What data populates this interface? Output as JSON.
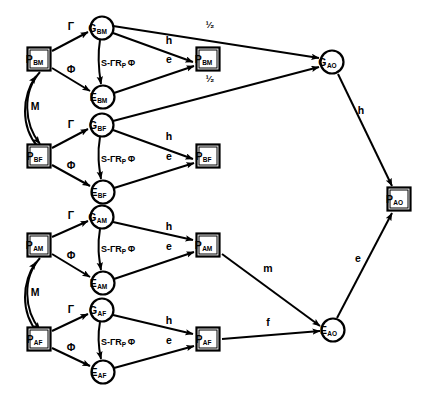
{
  "diagram": {
    "colors": {
      "stroke": "#000000",
      "fill": "#ffffff",
      "background": "#ffffff"
    },
    "nodes": [
      {
        "id": "P_BM",
        "name": "p-bm-box",
        "shape": "box",
        "base": "P",
        "sub": "BM",
        "x": 39,
        "y": 59
      },
      {
        "id": "G_BM",
        "name": "g-bm-node",
        "shape": "circle",
        "base": "G",
        "sub": "BM",
        "x": 102,
        "y": 28
      },
      {
        "id": "E_BM",
        "name": "e-bm-node",
        "shape": "circle",
        "base": "E",
        "sub": "BM",
        "x": 103,
        "y": 97
      },
      {
        "id": "PO_BM",
        "name": "p-bm-out-box",
        "shape": "box",
        "base": "P",
        "sub": "BM",
        "x": 208,
        "y": 59
      },
      {
        "id": "P_BF",
        "name": "p-bf-box",
        "shape": "box",
        "base": "P",
        "sub": "BF",
        "x": 39,
        "y": 156
      },
      {
        "id": "G_BF",
        "name": "g-bf-node",
        "shape": "circle",
        "base": "G",
        "sub": "BF",
        "x": 102,
        "y": 125
      },
      {
        "id": "E_BF",
        "name": "e-bf-node",
        "shape": "circle",
        "base": "E",
        "sub": "BF",
        "x": 103,
        "y": 192
      },
      {
        "id": "PO_BF",
        "name": "p-bf-out-box",
        "shape": "box",
        "base": "P",
        "sub": "BF",
        "x": 208,
        "y": 156
      },
      {
        "id": "P_AM",
        "name": "p-am-box",
        "shape": "box",
        "base": "P",
        "sub": "AM",
        "x": 39,
        "y": 245
      },
      {
        "id": "G_AM",
        "name": "g-am-node",
        "shape": "circle",
        "base": "G",
        "sub": "AM",
        "x": 102,
        "y": 217
      },
      {
        "id": "E_AM",
        "name": "e-am-node",
        "shape": "circle",
        "base": "E",
        "sub": "AM",
        "x": 103,
        "y": 283
      },
      {
        "id": "PO_AM",
        "name": "p-am-out-box",
        "shape": "box",
        "base": "P",
        "sub": "AM",
        "x": 208,
        "y": 245
      },
      {
        "id": "P_AF",
        "name": "p-af-box",
        "shape": "box",
        "base": "P",
        "sub": "AF",
        "x": 39,
        "y": 339
      },
      {
        "id": "G_AF",
        "name": "g-af-node",
        "shape": "circle",
        "base": "G",
        "sub": "AF",
        "x": 102,
        "y": 310
      },
      {
        "id": "E_AF",
        "name": "e-af-node",
        "shape": "circle",
        "base": "E",
        "sub": "AF",
        "x": 103,
        "y": 372
      },
      {
        "id": "PO_AF",
        "name": "p-af-out-box",
        "shape": "box",
        "base": "P",
        "sub": "AF",
        "x": 208,
        "y": 339
      },
      {
        "id": "G_AO",
        "name": "g-ao-node",
        "shape": "circle",
        "base": "G",
        "sub": "AO",
        "x": 332,
        "y": 62
      },
      {
        "id": "P_AO",
        "name": "p-ao-box",
        "shape": "box",
        "base": "P",
        "sub": "AO",
        "x": 399,
        "y": 199
      },
      {
        "id": "E_AO",
        "name": "e-ao-node",
        "shape": "circle",
        "base": "E",
        "sub": "AO",
        "x": 333,
        "y": 330
      }
    ],
    "edges": [
      {
        "name": "edge-pbm-gbm",
        "from": "P_BM",
        "to": "G_BM",
        "label": "Γ",
        "lx": 71,
        "ly": 30
      },
      {
        "name": "edge-pbm-ebm",
        "from": "P_BM",
        "to": "E_BM",
        "label": "Φ",
        "lx": 71,
        "ly": 73
      },
      {
        "name": "edge-gbm-ebm",
        "from": "G_BM",
        "to": "E_BM",
        "label": "S-ΓR",
        "sublabel": "P",
        "tail": "Φ",
        "lx": 118,
        "ly": 66,
        "curved": true
      },
      {
        "name": "edge-gbm-pbm",
        "from": "G_BM",
        "to": "PO_BM",
        "label": "h",
        "lx": 169,
        "ly": 44
      },
      {
        "name": "edge-ebm-pbm",
        "from": "E_BM",
        "to": "PO_BM",
        "label": "e",
        "lx": 169,
        "ly": 63
      },
      {
        "name": "edge-gbm-gao",
        "from": "G_BM",
        "to": "G_AO",
        "label": "¹⁄₂",
        "lx": 210,
        "ly": 28
      },
      {
        "name": "edge-gbf-gao",
        "from": "G_BF",
        "to": "G_AO",
        "label": "¹⁄₂",
        "lx": 210,
        "ly": 82
      },
      {
        "name": "edge-pbf-gbf",
        "from": "P_BF",
        "to": "G_BF",
        "label": "Γ",
        "lx": 71,
        "ly": 128
      },
      {
        "name": "edge-pbf-ebf",
        "from": "P_BF",
        "to": "E_BF",
        "label": "Φ",
        "lx": 71,
        "ly": 169
      },
      {
        "name": "edge-gbf-ebf",
        "from": "G_BF",
        "to": "E_BF",
        "label": "S-ΓR",
        "sublabel": "P",
        "tail": "Φ",
        "lx": 118,
        "ly": 162,
        "curved": true
      },
      {
        "name": "edge-gbf-pbf",
        "from": "G_BF",
        "to": "PO_BF",
        "label": "h",
        "lx": 169,
        "ly": 140
      },
      {
        "name": "edge-ebf-pbf",
        "from": "E_BF",
        "to": "PO_BF",
        "label": "e",
        "lx": 169,
        "ly": 160
      },
      {
        "name": "edge-pam-gam",
        "from": "P_AM",
        "to": "G_AM",
        "label": "Γ",
        "lx": 71,
        "ly": 219
      },
      {
        "name": "edge-pam-eam",
        "from": "P_AM",
        "to": "E_AM",
        "label": "Φ",
        "lx": 71,
        "ly": 259
      },
      {
        "name": "edge-gam-eam",
        "from": "G_AM",
        "to": "E_AM",
        "label": "S-ΓR",
        "sublabel": "P",
        "tail": "Φ",
        "lx": 118,
        "ly": 252,
        "curved": true
      },
      {
        "name": "edge-gam-pam",
        "from": "G_AM",
        "to": "PO_AM",
        "label": "h",
        "lx": 169,
        "ly": 230
      },
      {
        "name": "edge-eam-pam",
        "from": "E_AM",
        "to": "PO_AM",
        "label": "e",
        "lx": 169,
        "ly": 250
      },
      {
        "name": "edge-paf-gaf",
        "from": "P_AF",
        "to": "G_AF",
        "label": "Γ",
        "lx": 71,
        "ly": 313
      },
      {
        "name": "edge-paf-eaf",
        "from": "P_AF",
        "to": "E_AF",
        "label": "Φ",
        "lx": 71,
        "ly": 351
      },
      {
        "name": "edge-gaf-eaf",
        "from": "G_AF",
        "to": "E_AF",
        "label": "S-ΓR",
        "sublabel": "P",
        "tail": "Φ",
        "lx": 118,
        "ly": 345,
        "curved": true
      },
      {
        "name": "edge-gaf-paf",
        "from": "G_AF",
        "to": "PO_AF",
        "label": "h",
        "lx": 169,
        "ly": 324
      },
      {
        "name": "edge-eaf-paf",
        "from": "E_AF",
        "to": "PO_AF",
        "label": "e",
        "lx": 169,
        "ly": 344
      },
      {
        "name": "edge-m-upper",
        "from": "P_BM",
        "to": "P_BF",
        "label": "M",
        "lx": 35,
        "ly": 110,
        "curved": true
      },
      {
        "name": "edge-m-lower",
        "from": "P_AM",
        "to": "P_AF",
        "label": "M",
        "lx": 35,
        "ly": 296,
        "curved": true
      },
      {
        "name": "edge-gao-pao",
        "from": "G_AO",
        "to": "P_AO",
        "label": "h",
        "lx": 361,
        "ly": 114
      },
      {
        "name": "edge-eao-pao",
        "from": "E_AO",
        "to": "P_AO",
        "label": "e",
        "lx": 358,
        "ly": 262
      },
      {
        "name": "edge-pam-eao",
        "from": "PO_AM",
        "to": "E_AO",
        "label": "m",
        "lx": 268,
        "ly": 272
      },
      {
        "name": "edge-paf-eao",
        "from": "PO_AF",
        "to": "E_AO",
        "label": "f",
        "lx": 268,
        "ly": 326
      }
    ]
  }
}
